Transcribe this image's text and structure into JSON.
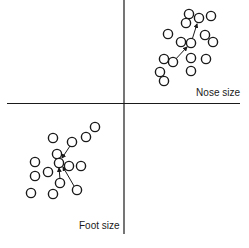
{
  "diagram": {
    "labels": {
      "horizontal_axis": "Nose size",
      "vertical_axis": "Foot size"
    },
    "colors": {
      "ink": "#1a1a1a",
      "background": "#ffffff"
    },
    "clusters": [
      {
        "name": "upper-right-cluster",
        "points": 16,
        "arrows": 2
      },
      {
        "name": "lower-left-cluster",
        "points": 15,
        "arrows": 3
      }
    ]
  }
}
